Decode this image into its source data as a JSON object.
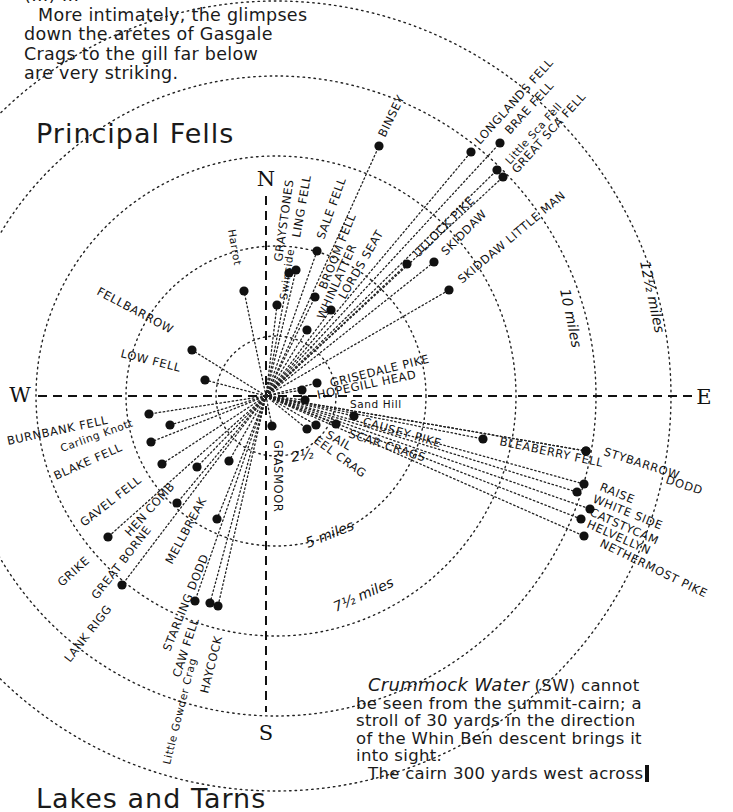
{
  "intro": {
    "lines": [
      "(...) ...",
      "More intimately, the glimpses",
      "down the aretes of Gasgale",
      "Crags to the gill far below",
      "are very striking."
    ]
  },
  "diagram": {
    "title": "Principal Fells",
    "center": {
      "x": 266,
      "y": 396
    },
    "compass": {
      "N": {
        "label": "N",
        "x": 266,
        "y": 186
      },
      "S": {
        "label": "S",
        "x": 266,
        "y": 740
      },
      "E": {
        "label": "E",
        "x": 704,
        "y": 404
      },
      "W": {
        "label": "W",
        "x": 20,
        "y": 402
      }
    },
    "distance_rings": [
      {
        "label": "2½",
        "radius": 60
      },
      {
        "label": "5 miles",
        "radius": 150
      },
      {
        "label": "7½ miles",
        "radius": 240
      },
      {
        "label": "10 miles",
        "radius": 320
      },
      {
        "label": "12½ miles",
        "radius": 395
      }
    ],
    "fells": [
      {
        "name": "BINSEY",
        "x": 379,
        "y": 146,
        "lx": 385,
        "ly": 138,
        "rot": -64
      },
      {
        "name": "LONGLANDS FELL",
        "x": 471,
        "y": 152,
        "lx": 480,
        "ly": 145,
        "rot": -48
      },
      {
        "name": "BRAE FELL",
        "x": 500,
        "y": 143,
        "lx": 510,
        "ly": 135,
        "rot": -48
      },
      {
        "name": "Little Sca Fell",
        "x": 497,
        "y": 170,
        "lx": 510,
        "ly": 165,
        "rot": -48
      },
      {
        "name": "GREAT SCA FELL",
        "x": 503,
        "y": 177,
        "lx": 517,
        "ly": 174,
        "rot": -48
      },
      {
        "name": "ULLOCK PIKE",
        "x": 407,
        "y": 264,
        "lx": 418,
        "ly": 258,
        "rot": -45
      },
      {
        "name": "SKIDDAW",
        "x": 434,
        "y": 262,
        "lx": 446,
        "ly": 256,
        "rot": -45
      },
      {
        "name": "SKIDDAW LITTLE MAN",
        "x": 449,
        "y": 290,
        "lx": 462,
        "ly": 284,
        "rot": -40
      },
      {
        "name": "GRAYSTONES",
        "x": 289,
        "y": 273,
        "lx": 282,
        "ly": 262,
        "rot": -82
      },
      {
        "name": "LING FELL",
        "x": 296,
        "y": 270,
        "lx": 300,
        "ly": 238,
        "rot": -80
      },
      {
        "name": "Swinside",
        "x": 277,
        "y": 305,
        "lx": 287,
        "ly": 300,
        "rot": -82
      },
      {
        "name": "SALE FELL",
        "x": 317,
        "y": 251,
        "lx": 324,
        "ly": 240,
        "rot": -70
      },
      {
        "name": "BROOM FELL",
        "x": 315,
        "y": 297,
        "lx": 326,
        "ly": 290,
        "rot": -68
      },
      {
        "name": "WHINLATTER",
        "x": 331,
        "y": 310,
        "lx": 324,
        "ly": 320,
        "rot": -66
      },
      {
        "name": "LORDS SEAT",
        "x": 307,
        "y": 330,
        "lx": 345,
        "ly": 300,
        "rot": -60
      },
      {
        "name": "Harrot",
        "x": 244,
        "y": 291,
        "lx": 228,
        "ly": 230,
        "rot": 80
      },
      {
        "name": "FELLBARROW",
        "x": 192,
        "y": 350,
        "lx": 96,
        "ly": 294,
        "rot": 28
      },
      {
        "name": "LOW FELL",
        "x": 205,
        "y": 380,
        "lx": 120,
        "ly": 357,
        "rot": 14
      },
      {
        "name": "BURNBANK FELL",
        "x": 149,
        "y": 414,
        "lx": 8,
        "ly": 445,
        "rot": -12
      },
      {
        "name": "Carling Knott",
        "x": 170,
        "y": 425,
        "lx": 62,
        "ly": 452,
        "rot": -20
      },
      {
        "name": "BLAKE FELL",
        "x": 151,
        "y": 442,
        "lx": 56,
        "ly": 480,
        "rot": -24
      },
      {
        "name": "GAVEL FELL",
        "x": 162,
        "y": 464,
        "lx": 84,
        "ly": 527,
        "rot": -38
      },
      {
        "name": "HEN COMB",
        "x": 197,
        "y": 467,
        "lx": 130,
        "ly": 537,
        "rot": -48
      },
      {
        "name": "GRIKE",
        "x": 108,
        "y": 537,
        "lx": 62,
        "ly": 587,
        "rot": -42
      },
      {
        "name": "GREAT BORNE",
        "x": 177,
        "y": 503,
        "lx": 97,
        "ly": 600,
        "rot": -52
      },
      {
        "name": "LANK RIGG",
        "x": 122,
        "y": 585,
        "lx": 70,
        "ly": 663,
        "rot": -52
      },
      {
        "name": "MELLBREAK",
        "x": 229,
        "y": 461,
        "lx": 172,
        "ly": 565,
        "rot": -62
      },
      {
        "name": "STARLING DODD",
        "x": 217,
        "y": 519,
        "lx": 170,
        "ly": 652,
        "rot": -68
      },
      {
        "name": "CAW FELL",
        "x": 195,
        "y": 601,
        "lx": 180,
        "ly": 678,
        "rot": -72
      },
      {
        "name": "Little Gowder Crag",
        "x": 210,
        "y": 603,
        "lx": 170,
        "ly": 765,
        "rot": -76
      },
      {
        "name": "HAYCOCK",
        "x": 218,
        "y": 606,
        "lx": 208,
        "ly": 694,
        "rot": -76
      },
      {
        "name": "GRASMOOR",
        "x": 272,
        "y": 426,
        "lx": 274,
        "ly": 440,
        "rot": 90
      },
      {
        "name": "GRISEDALE PIKE",
        "x": 317,
        "y": 383,
        "lx": 331,
        "ly": 387,
        "rot": -14
      },
      {
        "name": "HOPEGILL HEAD",
        "x": 302,
        "y": 390,
        "lx": 318,
        "ly": 399,
        "rot": -12
      },
      {
        "name": "Sand Hill",
        "x": 305,
        "y": 400,
        "lx": 350,
        "ly": 408,
        "rot": 0
      },
      {
        "name": "CAUSEY PIKE",
        "x": 354,
        "y": 416,
        "lx": 362,
        "ly": 425,
        "rot": 16
      },
      {
        "name": "SCAR CRAGS",
        "x": 336,
        "y": 424,
        "lx": 348,
        "ly": 437,
        "rot": 18
      },
      {
        "name": "SAIL",
        "x": 316,
        "y": 425,
        "lx": 325,
        "ly": 437,
        "rot": 30
      },
      {
        "name": "EEL CRAG",
        "x": 307,
        "y": 429,
        "lx": 313,
        "ly": 442,
        "rot": 36
      },
      {
        "name": "BLEABERRY FELL",
        "x": 483,
        "y": 439,
        "lx": 499,
        "ly": 445,
        "rot": 12
      },
      {
        "name": "STYBARROW",
        "x": 586,
        "y": 451,
        "lx": 603,
        "ly": 455,
        "rot": 18
      },
      {
        "name": "DODD",
        "x": 586,
        "y": 451,
        "lx": 665,
        "ly": 483,
        "rot": 18
      },
      {
        "name": "RAISE",
        "x": 584,
        "y": 484,
        "lx": 599,
        "ly": 490,
        "rot": 22
      },
      {
        "name": "WHITE SIDE",
        "x": 577,
        "y": 492,
        "lx": 592,
        "ly": 502,
        "rot": 22
      },
      {
        "name": "CATSTYCAM",
        "x": 590,
        "y": 509,
        "lx": 589,
        "ly": 515,
        "rot": 24
      },
      {
        "name": "HELVELLYN",
        "x": 581,
        "y": 519,
        "lx": 586,
        "ly": 527,
        "rot": 24
      },
      {
        "name": "NETHERMOST PIKE",
        "x": 584,
        "y": 536,
        "lx": 599,
        "ly": 546,
        "rot": 26
      }
    ]
  },
  "footnote": {
    "lake": "Crummock Water",
    "lines": [
      " (SW) cannot",
      "be seen from the summit-cairn; a",
      "stroll of 30 yards in the direction",
      "of the Whin Ben descent brings it",
      "into sight.",
      "The cairn 300 yards west across"
    ]
  },
  "next_section": {
    "title": "Lakes and Tarns"
  }
}
